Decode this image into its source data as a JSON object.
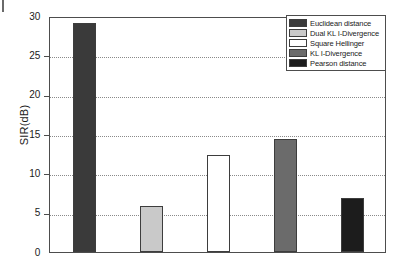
{
  "chart_data": {
    "type": "bar",
    "title": "",
    "xlabel": "",
    "ylabel": "SIR(dB)",
    "ylim": [
      0,
      30
    ],
    "yticks": [
      0,
      5,
      10,
      15,
      20,
      25,
      30
    ],
    "ytick_labels": [
      "0",
      "5",
      "10",
      "15",
      "20",
      "25",
      "30"
    ],
    "grid": "horizontal-dotted",
    "legend_position": "top-right",
    "xtick_labels": [],
    "categories": [
      "Euclidean distance",
      "Dual KL I-Divergence",
      "Square Hellinger",
      "KL I-Divergence",
      "Pearson distance"
    ],
    "values": [
      29.3,
      5.9,
      12.4,
      14.5,
      6.9
    ],
    "colors": [
      "#3a3a3a",
      "#c9c9c9",
      "#ffffff",
      "#6b6b6b",
      "#1c1c1c"
    ],
    "edge_color": "#3d3d3d",
    "series": [
      {
        "name": "SIR(dB)",
        "values": [
          29.3,
          5.9,
          12.4,
          14.5,
          6.9
        ]
      }
    ]
  },
  "legend": {
    "items": [
      {
        "label": "Euclidean distance",
        "color": "#3a3a3a"
      },
      {
        "label": "Dual KL I-Divergence",
        "color": "#c9c9c9"
      },
      {
        "label": "Square Hellinger",
        "color": "#ffffff"
      },
      {
        "label": "KL I-Divergence",
        "color": "#6b6b6b"
      },
      {
        "label": "Pearson distance",
        "color": "#1c1c1c"
      }
    ]
  },
  "axis": {
    "y_title": "SIR(dB)",
    "tick_labels": [
      "30",
      "25",
      "20",
      "15",
      "10",
      "5",
      "0"
    ]
  }
}
